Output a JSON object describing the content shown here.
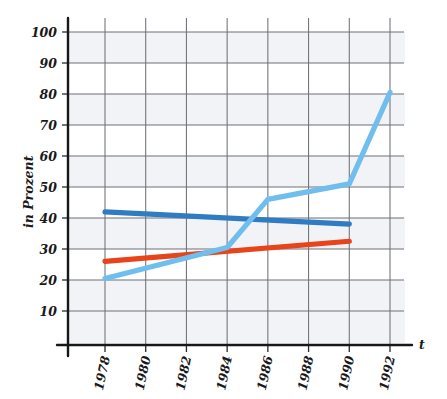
{
  "chart_data": {
    "type": "line",
    "title": "",
    "subtitle": "",
    "xlabel": "t",
    "ylabel": "in Prozent",
    "x": [
      1978,
      1980,
      1982,
      1984,
      1986,
      1988,
      1990,
      1992
    ],
    "xtick_labels": [
      "1978",
      "1980",
      "1982",
      "1984",
      "1986",
      "1988",
      "1990",
      "1992"
    ],
    "ytick_labels": [
      "10",
      "20",
      "30",
      "40",
      "50",
      "60",
      "70",
      "80",
      "90",
      "100"
    ],
    "yticks": [
      10,
      20,
      30,
      40,
      50,
      60,
      70,
      80,
      90,
      100
    ],
    "xlim": [
      1978,
      1992
    ],
    "ylim": [
      0,
      100
    ],
    "grid": true,
    "legend": "none",
    "series": [
      {
        "name": "dark-blue-series",
        "color": "#2f7cc2",
        "x": [
          1978,
          1990
        ],
        "values": [
          42,
          38
        ]
      },
      {
        "name": "orange-red-series",
        "color": "#e8441b",
        "x": [
          1978,
          1990
        ],
        "values": [
          26,
          32.5
        ]
      },
      {
        "name": "light-blue-series",
        "color": "#6fbeee",
        "x": [
          1978,
          1984,
          1986,
          1990,
          1992
        ],
        "values": [
          20.5,
          30.5,
          46,
          51,
          80.5
        ]
      }
    ]
  },
  "axes": {
    "y_axis_title": "in Prozent",
    "x_axis_title": "t"
  },
  "colors": {
    "dark_blue": "#2f7cc2",
    "orange_red": "#e8441b",
    "light_blue": "#6fbeee",
    "grid": "#6f7176",
    "axis": "#17171a",
    "band": "#eef1f5",
    "background": "#ffffff"
  }
}
